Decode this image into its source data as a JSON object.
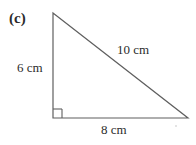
{
  "figure": {
    "part_label": "(c)",
    "shape": "right-triangle",
    "labels": {
      "vertical_side": "6 cm",
      "hypotenuse": "10 cm",
      "horizontal_side": "8 cm"
    },
    "geometry": {
      "apex": [
        53,
        13
      ],
      "right_angle_vertex": [
        53,
        118
      ],
      "base_right_vertex": [
        188,
        118
      ],
      "right_angle_marker_size": 9
    },
    "colors": {
      "background": "#ffffff",
      "stroke": "#5f5f5f",
      "text": "#2b2b2b"
    }
  }
}
